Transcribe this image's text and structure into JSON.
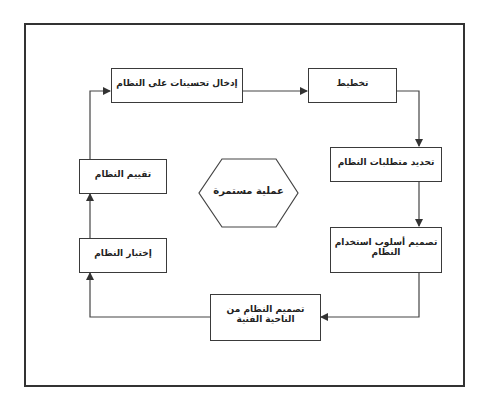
{
  "diagram": {
    "type": "cycle-flowchart",
    "center_label": "عملية مستمرة",
    "steps": [
      {
        "id": "planning",
        "label": "تخطيط"
      },
      {
        "id": "requirements",
        "label": "تحديد متطلبات النظام"
      },
      {
        "id": "usage-design",
        "label": "تصميم أسلوب استخدام النظام"
      },
      {
        "id": "technical-design",
        "label": "تصميم النظام من الناحية الفنية"
      },
      {
        "id": "testing",
        "label": "إختبار النظام"
      },
      {
        "id": "evaluation",
        "label": "تقييم النظام"
      },
      {
        "id": "improvements",
        "label": "إدخال تحسينات على النظام"
      }
    ],
    "flow": [
      [
        "improvements",
        "planning"
      ],
      [
        "planning",
        "requirements"
      ],
      [
        "requirements",
        "usage-design"
      ],
      [
        "usage-design",
        "technical-design"
      ],
      [
        "technical-design",
        "testing"
      ],
      [
        "testing",
        "evaluation"
      ],
      [
        "evaluation",
        "improvements"
      ]
    ],
    "colors": {
      "stroke": "#333333",
      "background": "#ffffff",
      "text": "#222222"
    }
  }
}
